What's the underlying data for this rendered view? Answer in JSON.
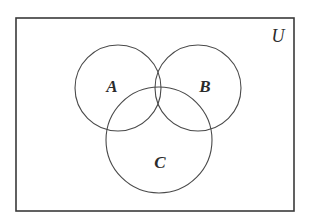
{
  "figure": {
    "kind": "venn-diagram",
    "caption": "",
    "background_color": "#ffffff"
  },
  "universe": {
    "label": "U",
    "label_x": 278,
    "label_y": 38,
    "rect": {
      "x": 16,
      "y": 18,
      "width": 278,
      "height": 193
    },
    "stroke_color": "#3a3a3a",
    "stroke_width": 1.6,
    "fill_color": "#ffffff"
  },
  "style": {
    "circle_stroke_color": "#4a4a4a",
    "circle_stroke_width": 1.1,
    "label_color": "#2b2b2b"
  },
  "sets": [
    {
      "id": "A",
      "label": "A",
      "cx": 118,
      "cy": 88,
      "r": 43,
      "label_x": 112,
      "label_y": 88
    },
    {
      "id": "B",
      "label": "B",
      "cx": 198,
      "cy": 88,
      "r": 43,
      "label_x": 205,
      "label_y": 88
    },
    {
      "id": "C",
      "label": "C",
      "cx": 159,
      "cy": 140,
      "r": 53,
      "label_x": 160,
      "label_y": 164
    }
  ],
  "chart_data": {
    "type": "diagram",
    "subtype": "venn",
    "title": "",
    "universe_label": "U",
    "set_labels": [
      "A",
      "B",
      "C"
    ],
    "set_count": 3,
    "regions": [
      "A only",
      "B only",
      "C only",
      "A and B",
      "A and C",
      "B and C",
      "A and B and C",
      "outside all sets"
    ],
    "values": [],
    "legend": "none",
    "grid": false
  }
}
